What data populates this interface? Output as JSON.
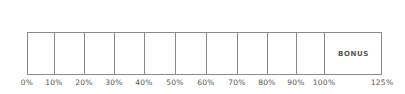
{
  "scale": {
    "bonus_label": "BONUS",
    "ticks": [
      "0%",
      "10%",
      "20%",
      "30%",
      "40%",
      "50%",
      "60%",
      "70%",
      "80%",
      "90%",
      "100%",
      "125%"
    ]
  },
  "colors": {
    "border": "#8a8a8a",
    "text": "#555555",
    "background": "#ffffff"
  }
}
